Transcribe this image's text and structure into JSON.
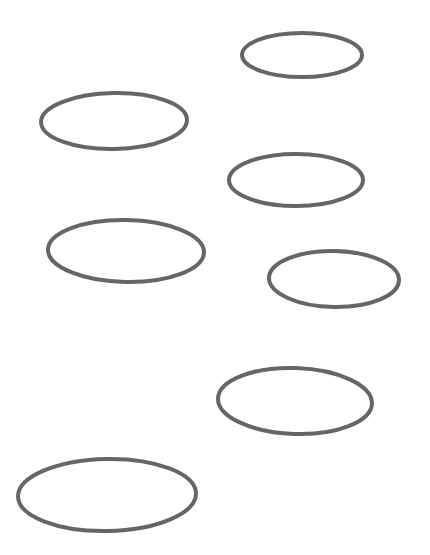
{
  "canvas": {
    "width": 430,
    "height": 555,
    "background": "#ffffff"
  },
  "style": {
    "stroke": "#666666",
    "stroke_width": 4
  },
  "ellipses": [
    {
      "id": "ellipse-1",
      "cx": 302,
      "cy": 55,
      "rx": 60,
      "ry": 22,
      "rotate": 0
    },
    {
      "id": "ellipse-2",
      "cx": 114,
      "cy": 121,
      "rx": 73,
      "ry": 28,
      "rotate": -1
    },
    {
      "id": "ellipse-3",
      "cx": 296,
      "cy": 180,
      "rx": 67,
      "ry": 26,
      "rotate": 0
    },
    {
      "id": "ellipse-4",
      "cx": 126,
      "cy": 251,
      "rx": 78,
      "ry": 31,
      "rotate": 1
    },
    {
      "id": "ellipse-5",
      "cx": 334,
      "cy": 279,
      "rx": 65,
      "ry": 28,
      "rotate": 1
    },
    {
      "id": "ellipse-6",
      "cx": 295,
      "cy": 401,
      "rx": 77,
      "ry": 33,
      "rotate": 2
    },
    {
      "id": "ellipse-7",
      "cx": 107,
      "cy": 495,
      "rx": 89,
      "ry": 36,
      "rotate": -1
    }
  ]
}
